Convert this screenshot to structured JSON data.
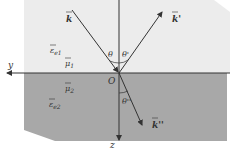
{
  "diagram": {
    "colors": {
      "upper_medium": "#ececec",
      "lower_medium": "#a8a8a8",
      "lines": "#333333",
      "background": "#ffffff"
    },
    "axes": {
      "y_label": "y",
      "z_label": "z",
      "origin_label": "O"
    },
    "waves": {
      "incident_label": "k",
      "reflected_label": "k'",
      "transmitted_label": "k''"
    },
    "angles": {
      "incident": "θ",
      "reflected": "θ'",
      "transmitted": "θ''"
    },
    "media": {
      "upper": {
        "epsilon": "ε",
        "epsilon_sub": "e1",
        "mu": "μ",
        "mu_sub": "1"
      },
      "lower": {
        "epsilon": "ε",
        "epsilon_sub": "e2",
        "mu": "μ",
        "mu_sub": "2"
      }
    }
  }
}
